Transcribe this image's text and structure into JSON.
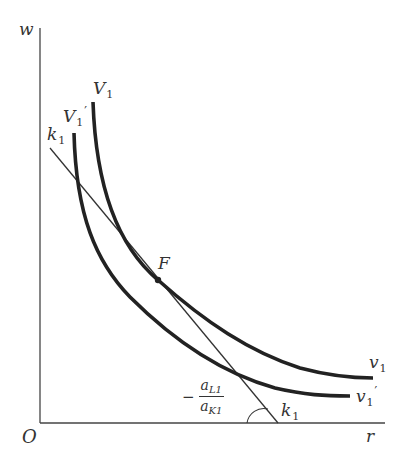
{
  "diagram": {
    "axes": {
      "y_label": "w",
      "x_label": "r",
      "origin_label": "O"
    },
    "curves": [
      {
        "name": "V1",
        "top_label": "V",
        "top_sub": "1",
        "bottom_label": "v",
        "bottom_sub": "1",
        "prime": ""
      },
      {
        "name": "V1'",
        "top_label": "V",
        "top_sub": "1",
        "bottom_label": "v",
        "bottom_sub": "1",
        "prime": "′"
      }
    ],
    "line": {
      "top_label": "k",
      "top_sub": "1",
      "bottom_label": "k",
      "bottom_sub": "1"
    },
    "point": {
      "label": "F"
    },
    "slope": {
      "minus": "−",
      "num_main": "a",
      "num_sub": "L1",
      "den_main": "a",
      "den_sub": "K1"
    },
    "colors": {
      "curve": "#222222",
      "line": "#333333",
      "axis": "#444444",
      "text": "#333333"
    }
  }
}
